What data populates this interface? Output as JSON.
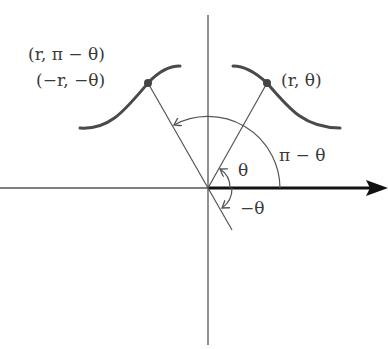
{
  "diagram": {
    "type": "polar-coordinates-symmetry",
    "labels": {
      "point_right": "(r, θ)",
      "point_left_a": "(r, π − θ)",
      "point_left_b": "(−r, −θ)",
      "angle_theta": "θ",
      "angle_pi_minus_theta": "π − θ",
      "angle_neg_theta": "−θ"
    },
    "colors": {
      "line": "#555555",
      "curve": "#4a4a4a",
      "axis_polar": "#111111",
      "text": "#3a3a3a"
    }
  }
}
